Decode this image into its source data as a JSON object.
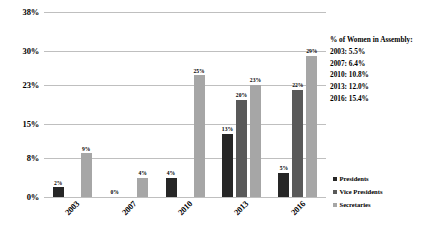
{
  "chart_data": {
    "type": "bar",
    "title": "",
    "xlabel": "",
    "ylabel": "",
    "categories": [
      "2003",
      "2007",
      "2010",
      "2013",
      "2016"
    ],
    "series": [
      {
        "name": "Presidents",
        "color": "#262626",
        "values": [
          2,
          0,
          4,
          13,
          5
        ],
        "labels": [
          "2%",
          "0%",
          "4%",
          "13%",
          "5%"
        ]
      },
      {
        "name": "Vice Presidents",
        "color": "#595959",
        "values": [
          0,
          0,
          0,
          20,
          22
        ],
        "labels": [
          "",
          "",
          "",
          "20%",
          "22%"
        ]
      },
      {
        "name": "Secretaries",
        "color": "#a6a6a6",
        "values": [
          9,
          4,
          25,
          23,
          29
        ],
        "labels": [
          "9%",
          "4%",
          "25%",
          "23%",
          "29%"
        ]
      }
    ],
    "ylim": [
      0,
      38
    ],
    "yticks": [
      0,
      8,
      15,
      23,
      30,
      38
    ],
    "ytick_labels": [
      "0%",
      "8%",
      "15%",
      "23%",
      "30%",
      "38%"
    ],
    "grid": true,
    "legend_position": "bottom-right",
    "annotation": {
      "title": "% of Women in Assembly:",
      "rows": [
        "2003: 5.5%",
        "2007: 6.4%",
        "2010: 10.8%",
        "2013: 12.0%",
        "2016: 15.4%"
      ]
    }
  },
  "legend": {
    "items": [
      {
        "label": "Presidents",
        "color": "#262626"
      },
      {
        "label": "Vice Presidents",
        "color": "#595959"
      },
      {
        "label": "Secretaries",
        "color": "#a6a6a6"
      }
    ]
  },
  "colors": {
    "gridline": "#bfbfbf",
    "text": "#000000",
    "background": "#ffffff"
  }
}
